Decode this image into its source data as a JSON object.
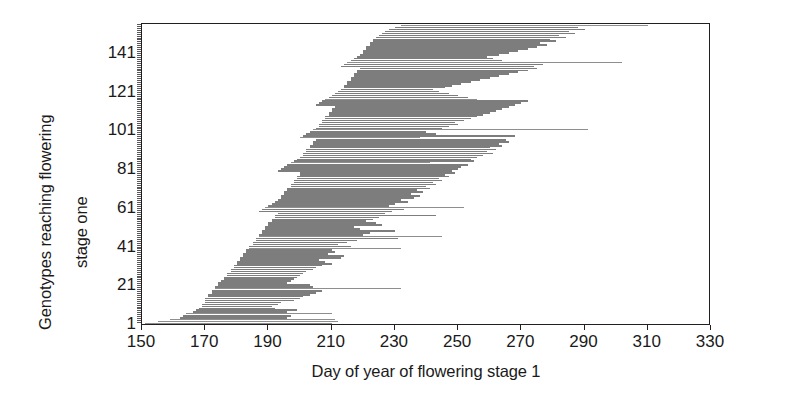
{
  "chart_data": {
    "type": "bar",
    "orientation": "horizontal",
    "title": "",
    "xlabel": "Day of year of flowering stage 1",
    "ylabel": "Genotypes reaching flowering stage one",
    "ylabel_lines": [
      "Genotypes reaching flowering",
      "stage one"
    ],
    "xlim": [
      150,
      330
    ],
    "ylim": [
      1,
      155
    ],
    "xticks": [
      150,
      170,
      190,
      210,
      230,
      250,
      270,
      290,
      310,
      330
    ],
    "xticklabels": [
      "150",
      "170",
      "190",
      "210",
      "230",
      "250",
      "270",
      "290",
      "310",
      "330"
    ],
    "yticks": [
      1,
      21,
      41,
      61,
      81,
      101,
      121,
      141
    ],
    "yticklabels": [
      "1",
      "21",
      "41",
      "61",
      "81",
      "101",
      "121",
      "141"
    ],
    "grid": false,
    "legend": null,
    "bar_color": "#7d7d7d",
    "frame_color": "#231f20",
    "background": "#ffffff",
    "note": "Each row is one genotype; the bar spans the day-of-year range over which that genotype reached flowering stage 1 (start day to end day).",
    "categories": [
      1,
      2,
      3,
      4,
      5,
      6,
      7,
      8,
      9,
      10,
      11,
      12,
      13,
      14,
      15,
      16,
      17,
      18,
      19,
      20,
      21,
      22,
      23,
      24,
      25,
      26,
      27,
      28,
      29,
      30,
      31,
      32,
      33,
      34,
      35,
      36,
      37,
      38,
      39,
      40,
      41,
      42,
      43,
      44,
      45,
      46,
      47,
      48,
      49,
      50,
      51,
      52,
      53,
      54,
      55,
      56,
      57,
      58,
      59,
      60,
      61,
      62,
      63,
      64,
      65,
      66,
      67,
      68,
      69,
      70,
      71,
      72,
      73,
      74,
      75,
      76,
      77,
      78,
      79,
      80,
      81,
      82,
      83,
      84,
      85,
      86,
      87,
      88,
      89,
      90,
      91,
      92,
      93,
      94,
      95,
      96,
      97,
      98,
      99,
      100,
      101,
      102,
      103,
      104,
      105,
      106,
      107,
      108,
      109,
      110,
      111,
      112,
      113,
      114,
      115,
      116,
      117,
      118,
      119,
      120,
      121,
      122,
      123,
      124,
      125,
      126,
      127,
      128,
      129,
      130,
      131,
      132,
      133,
      134,
      135,
      136,
      137,
      138,
      139,
      140,
      141,
      142,
      143,
      144,
      145,
      146,
      147,
      148,
      149,
      150,
      151,
      152,
      153,
      154,
      155
    ],
    "bars": [
      {
        "g": 1,
        "start": 151,
        "end": 210,
        "w": "thin"
      },
      {
        "g": 2,
        "start": 155,
        "end": 212,
        "w": "thin"
      },
      {
        "g": 3,
        "start": 159,
        "end": 211,
        "w": "thin"
      },
      {
        "g": 4,
        "start": 162,
        "end": 196
      },
      {
        "g": 5,
        "start": 163,
        "end": 197
      },
      {
        "g": 6,
        "start": 164,
        "end": 210,
        "w": "thin"
      },
      {
        "g": 7,
        "start": 166,
        "end": 196
      },
      {
        "g": 8,
        "start": 167,
        "end": 199
      },
      {
        "g": 9,
        "start": 168,
        "end": 192
      },
      {
        "g": 10,
        "start": 169,
        "end": 191
      },
      {
        "g": 11,
        "start": 169,
        "end": 193
      },
      {
        "g": 12,
        "start": 170,
        "end": 194
      },
      {
        "g": 13,
        "start": 170,
        "end": 198
      },
      {
        "g": 14,
        "start": 170,
        "end": 200
      },
      {
        "g": 15,
        "start": 171,
        "end": 201
      },
      {
        "g": 16,
        "start": 171,
        "end": 203
      },
      {
        "g": 17,
        "start": 172,
        "end": 205
      },
      {
        "g": 18,
        "start": 172,
        "end": 207
      },
      {
        "g": 19,
        "start": 173,
        "end": 232,
        "w": "thin"
      },
      {
        "g": 20,
        "start": 173,
        "end": 204
      },
      {
        "g": 21,
        "start": 174,
        "end": 203
      },
      {
        "g": 22,
        "start": 174,
        "end": 196
      },
      {
        "g": 23,
        "start": 175,
        "end": 197
      },
      {
        "g": 24,
        "start": 176,
        "end": 198
      },
      {
        "g": 25,
        "start": 176,
        "end": 199
      },
      {
        "g": 26,
        "start": 177,
        "end": 200
      },
      {
        "g": 27,
        "start": 177,
        "end": 201
      },
      {
        "g": 28,
        "start": 178,
        "end": 202
      },
      {
        "g": 29,
        "start": 178,
        "end": 204
      },
      {
        "g": 30,
        "start": 179,
        "end": 205
      },
      {
        "g": 31,
        "start": 179,
        "end": 207
      },
      {
        "g": 32,
        "start": 180,
        "end": 210
      },
      {
        "g": 33,
        "start": 180,
        "end": 208
      },
      {
        "g": 34,
        "start": 181,
        "end": 206
      },
      {
        "g": 35,
        "start": 181,
        "end": 213
      },
      {
        "g": 36,
        "start": 182,
        "end": 214
      },
      {
        "g": 37,
        "start": 182,
        "end": 209
      },
      {
        "g": 38,
        "start": 183,
        "end": 211
      },
      {
        "g": 39,
        "start": 183,
        "end": 210
      },
      {
        "g": 40,
        "start": 184,
        "end": 232,
        "w": "thin"
      },
      {
        "g": 41,
        "start": 184,
        "end": 216
      },
      {
        "g": 42,
        "start": 185,
        "end": 212
      },
      {
        "g": 43,
        "start": 185,
        "end": 215
      },
      {
        "g": 44,
        "start": 186,
        "end": 218
      },
      {
        "g": 45,
        "start": 186,
        "end": 231
      },
      {
        "g": 46,
        "start": 187,
        "end": 245,
        "w": "thin"
      },
      {
        "g": 47,
        "start": 187,
        "end": 220
      },
      {
        "g": 48,
        "start": 188,
        "end": 222
      },
      {
        "g": 49,
        "start": 188,
        "end": 230
      },
      {
        "g": 50,
        "start": 189,
        "end": 219
      },
      {
        "g": 51,
        "start": 189,
        "end": 217
      },
      {
        "g": 52,
        "start": 190,
        "end": 226
      },
      {
        "g": 53,
        "start": 190,
        "end": 224
      },
      {
        "g": 54,
        "start": 191,
        "end": 221
      },
      {
        "g": 55,
        "start": 191,
        "end": 223
      },
      {
        "g": 56,
        "start": 192,
        "end": 225
      },
      {
        "g": 57,
        "start": 192,
        "end": 243
      },
      {
        "g": 58,
        "start": 193,
        "end": 227
      },
      {
        "g": 59,
        "start": 187,
        "end": 229
      },
      {
        "g": 60,
        "start": 188,
        "end": 233
      },
      {
        "g": 61,
        "start": 189,
        "end": 252,
        "w": "thin"
      },
      {
        "g": 62,
        "start": 190,
        "end": 228
      },
      {
        "g": 63,
        "start": 191,
        "end": 230
      },
      {
        "g": 64,
        "start": 192,
        "end": 234
      },
      {
        "g": 65,
        "start": 193,
        "end": 232
      },
      {
        "g": 66,
        "start": 194,
        "end": 236
      },
      {
        "g": 67,
        "start": 194,
        "end": 238
      },
      {
        "g": 68,
        "start": 195,
        "end": 235
      },
      {
        "g": 69,
        "start": 195,
        "end": 239
      },
      {
        "g": 70,
        "start": 196,
        "end": 237
      },
      {
        "g": 71,
        "start": 196,
        "end": 241
      },
      {
        "g": 72,
        "start": 197,
        "end": 240
      },
      {
        "g": 73,
        "start": 197,
        "end": 243
      },
      {
        "g": 74,
        "start": 198,
        "end": 242
      },
      {
        "g": 75,
        "start": 198,
        "end": 245
      },
      {
        "g": 76,
        "start": 199,
        "end": 244
      },
      {
        "g": 77,
        "start": 199,
        "end": 247
      },
      {
        "g": 78,
        "start": 200,
        "end": 246
      },
      {
        "g": 79,
        "start": 200,
        "end": 249
      },
      {
        "g": 80,
        "start": 193,
        "end": 248
      },
      {
        "g": 81,
        "start": 194,
        "end": 250
      },
      {
        "g": 82,
        "start": 195,
        "end": 251
      },
      {
        "g": 83,
        "start": 196,
        "end": 253
      },
      {
        "g": 84,
        "start": 197,
        "end": 241,
        "w": "thin"
      },
      {
        "g": 85,
        "start": 198,
        "end": 255
      },
      {
        "g": 86,
        "start": 199,
        "end": 254
      },
      {
        "g": 87,
        "start": 200,
        "end": 256
      },
      {
        "g": 88,
        "start": 201,
        "end": 258
      },
      {
        "g": 89,
        "start": 201,
        "end": 261
      },
      {
        "g": 90,
        "start": 202,
        "end": 259
      },
      {
        "g": 91,
        "start": 202,
        "end": 262
      },
      {
        "g": 92,
        "start": 203,
        "end": 260
      },
      {
        "g": 93,
        "start": 203,
        "end": 264
      },
      {
        "g": 94,
        "start": 204,
        "end": 263
      },
      {
        "g": 95,
        "start": 204,
        "end": 266
      },
      {
        "g": 96,
        "start": 205,
        "end": 265
      },
      {
        "g": 97,
        "start": 200,
        "end": 238,
        "w": "thin"
      },
      {
        "g": 98,
        "start": 201,
        "end": 268
      },
      {
        "g": 99,
        "start": 202,
        "end": 243
      },
      {
        "g": 100,
        "start": 203,
        "end": 240
      },
      {
        "g": 101,
        "start": 204,
        "end": 291,
        "w": "thin"
      },
      {
        "g": 102,
        "start": 205,
        "end": 245
      },
      {
        "g": 103,
        "start": 206,
        "end": 247
      },
      {
        "g": 104,
        "start": 206,
        "end": 250
      },
      {
        "g": 105,
        "start": 207,
        "end": 249
      },
      {
        "g": 106,
        "start": 207,
        "end": 252
      },
      {
        "g": 107,
        "start": 208,
        "end": 254
      },
      {
        "g": 108,
        "start": 208,
        "end": 256
      },
      {
        "g": 109,
        "start": 209,
        "end": 258
      },
      {
        "g": 110,
        "start": 209,
        "end": 260
      },
      {
        "g": 111,
        "start": 210,
        "end": 262
      },
      {
        "g": 112,
        "start": 210,
        "end": 264
      },
      {
        "g": 113,
        "start": 211,
        "end": 266
      },
      {
        "g": 114,
        "start": 205,
        "end": 268
      },
      {
        "g": 115,
        "start": 206,
        "end": 270
      },
      {
        "g": 116,
        "start": 207,
        "end": 272
      },
      {
        "g": 117,
        "start": 208,
        "end": 256,
        "w": "thin"
      },
      {
        "g": 118,
        "start": 209,
        "end": 253
      },
      {
        "g": 119,
        "start": 210,
        "end": 250
      },
      {
        "g": 120,
        "start": 211,
        "end": 247
      },
      {
        "g": 121,
        "start": 212,
        "end": 244
      },
      {
        "g": 122,
        "start": 213,
        "end": 242
      },
      {
        "g": 123,
        "start": 214,
        "end": 246
      },
      {
        "g": 124,
        "start": 214,
        "end": 248
      },
      {
        "g": 125,
        "start": 215,
        "end": 251
      },
      {
        "g": 126,
        "start": 215,
        "end": 254
      },
      {
        "g": 127,
        "start": 216,
        "end": 257
      },
      {
        "g": 128,
        "start": 216,
        "end": 260
      },
      {
        "g": 129,
        "start": 217,
        "end": 263
      },
      {
        "g": 130,
        "start": 217,
        "end": 266
      },
      {
        "g": 131,
        "start": 218,
        "end": 269
      },
      {
        "g": 132,
        "start": 218,
        "end": 272
      },
      {
        "g": 133,
        "start": 219,
        "end": 275
      },
      {
        "g": 134,
        "start": 213,
        "end": 274
      },
      {
        "g": 135,
        "start": 214,
        "end": 277
      },
      {
        "g": 136,
        "start": 215,
        "end": 302,
        "w": "thin"
      },
      {
        "g": 137,
        "start": 216,
        "end": 264
      },
      {
        "g": 138,
        "start": 217,
        "end": 261
      },
      {
        "g": 139,
        "start": 218,
        "end": 259
      },
      {
        "g": 140,
        "start": 219,
        "end": 263
      },
      {
        "g": 141,
        "start": 220,
        "end": 266
      },
      {
        "g": 142,
        "start": 220,
        "end": 269
      },
      {
        "g": 143,
        "start": 221,
        "end": 272
      },
      {
        "g": 144,
        "start": 221,
        "end": 275
      },
      {
        "g": 145,
        "start": 222,
        "end": 278
      },
      {
        "g": 146,
        "start": 222,
        "end": 276
      },
      {
        "g": 147,
        "start": 223,
        "end": 281
      },
      {
        "g": 148,
        "start": 223,
        "end": 279
      },
      {
        "g": 149,
        "start": 224,
        "end": 284
      },
      {
        "g": 150,
        "start": 225,
        "end": 282
      },
      {
        "g": 151,
        "start": 226,
        "end": 287
      },
      {
        "g": 152,
        "start": 227,
        "end": 285
      },
      {
        "g": 153,
        "start": 228,
        "end": 290
      },
      {
        "g": 154,
        "start": 230,
        "end": 288
      },
      {
        "g": 155,
        "start": 232,
        "end": 310,
        "w": "thin"
      }
    ]
  }
}
